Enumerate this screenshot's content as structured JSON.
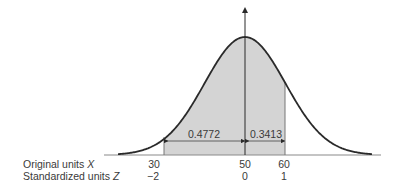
{
  "diagram": {
    "type": "normal-distribution",
    "mean_x": 50,
    "sd_x": 10,
    "shaded_region": {
      "from_x": 30,
      "to_x": 60,
      "from_z": -2,
      "to_z": 1
    },
    "areas": [
      {
        "label": "0.4772",
        "from_z": -2,
        "to_z": 0
      },
      {
        "label": "0.3413",
        "from_z": 0,
        "to_z": 1
      }
    ],
    "rows": [
      {
        "label": "Original units",
        "var": "X",
        "ticks": [
          "30",
          "50",
          "60"
        ]
      },
      {
        "label": "Standardized units",
        "var": "Z",
        "ticks": [
          "−2",
          "0",
          "1"
        ]
      }
    ],
    "colors": {
      "shade": "#d4d4d4",
      "curve": "#2a2a2a",
      "axis": "#8a8a8a"
    }
  }
}
